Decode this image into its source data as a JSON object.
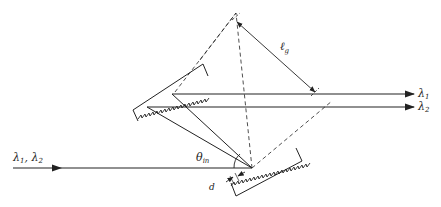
{
  "diagram": {
    "labels": {
      "input_beams": "λ1, λ2",
      "input_main": "λ",
      "input_sub1": "1",
      "input_comma": ", ",
      "input_sub2": "2",
      "output_1_main": "λ",
      "output_1_sub": "1",
      "output_2_main": "λ",
      "output_2_sub": "2",
      "grating_separation_main": "ℓ",
      "grating_separation_sub": "g",
      "incidence_angle_main": "θ",
      "incidence_angle_sub": "in",
      "groove_spacing": "d"
    },
    "colors": {
      "line": "#222222",
      "background": "#ffffff"
    }
  }
}
